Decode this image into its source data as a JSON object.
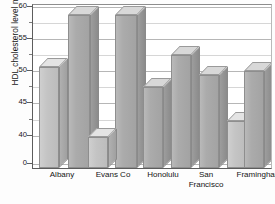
{
  "chart_data": {
    "type": "bar",
    "title": "",
    "xlabel": "",
    "ylabel": "HDL cholesterol level mg/dl",
    "categories": [
      "Albany",
      "Evans Co",
      "Honolulu",
      "San Francisco",
      "Framingham"
    ],
    "series": [
      {
        "name": "bar-1",
        "values": [
          51.5,
          60.5,
          47.0,
          49.5,
          51.0
        ]
      },
      {
        "name": "bar-2",
        "values": [
          60.5,
          41.0,
          52.0,
          55.0,
          40.5
        ]
      },
      {
        "name": "bar-3",
        "values": [
          null,
          null,
          null,
          43.0,
          null
        ]
      }
    ],
    "ylim": [
      40,
      60
    ],
    "axis_break": true,
    "zero_tick": "0",
    "ytick_labels": [
      "60",
      "55",
      "50",
      "45",
      "40",
      "0"
    ],
    "ytick_values": [
      60,
      55,
      50,
      45,
      40,
      0
    ],
    "yminor_values": [
      57.5,
      52.5,
      47.5,
      42.5
    ],
    "grid": true,
    "legend": "none",
    "bar_style": "3d-extruded-gray"
  },
  "axis": {
    "y_title": "HDL cholesterol level mg/dl",
    "ticks": [
      {
        "label": "60",
        "y": 6
      },
      {
        "label": "55",
        "y": 38
      },
      {
        "label": "50",
        "y": 70
      },
      {
        "label": "45",
        "y": 102
      },
      {
        "label": "40",
        "y": 135
      },
      {
        "label": "0",
        "y": 163
      }
    ],
    "minor_ticks_y": [
      22,
      54,
      86,
      119
    ]
  },
  "bars": [
    {
      "name": "albany-bar-1",
      "left": 6,
      "width": 20,
      "top": 66,
      "shade": "light"
    },
    {
      "name": "albany-bar-2",
      "left": 35,
      "width": 22,
      "top": 14,
      "shade": "dark"
    },
    {
      "name": "evansco-bar-1",
      "left": 82,
      "width": 22,
      "top": 14,
      "shade": "dark"
    },
    {
      "name": "evansco-bar-2",
      "left": 55,
      "width": 20,
      "top": 136,
      "shade": "light"
    },
    {
      "name": "honolulu-bar-1",
      "left": 110,
      "width": 20,
      "top": 86,
      "shade": "dark"
    },
    {
      "name": "honolulu-bar-2",
      "left": 138,
      "width": 20,
      "top": 54,
      "shade": "dark"
    },
    {
      "name": "sanfrancisco-bar-1",
      "left": 166,
      "width": 20,
      "top": 74,
      "shade": "dark"
    },
    {
      "name": "sanfrancisco-bar-2",
      "left": 194,
      "width": 20,
      "top": 120,
      "shade": "light"
    },
    {
      "name": "framingham-bar-1",
      "left": 211,
      "width": 20,
      "top": 70,
      "shade": "dark"
    }
  ],
  "xlabels": [
    {
      "text": "Albany",
      "left": 2,
      "width": 56,
      "line2": ""
    },
    {
      "text": "Evans Co",
      "left": 52,
      "width": 58,
      "line2": ""
    },
    {
      "text": "Honolulu",
      "left": 104,
      "width": 54,
      "line2": ""
    },
    {
      "text": "San",
      "left": 148,
      "width": 52,
      "line2": "Francisco"
    },
    {
      "text": "Framingham",
      "left": 190,
      "width": 74,
      "line2": ""
    }
  ]
}
